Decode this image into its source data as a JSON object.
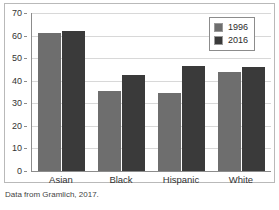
{
  "caption": "Data from Gramlich, 2017.",
  "legend": {
    "position": "top-right",
    "entries": [
      {
        "label": "1996",
        "color": "#6e6e6e",
        "icon": "legend-swatch-icon"
      },
      {
        "label": "2016",
        "color": "#3a3a3a",
        "icon": "legend-swatch-icon"
      }
    ]
  },
  "axis": {
    "y_ticks": [
      "70",
      "60",
      "50",
      "40",
      "30",
      "20",
      "10",
      "0"
    ]
  },
  "chart_data": {
    "type": "bar",
    "title": "",
    "subtitle": "",
    "xlabel": "",
    "ylabel": "",
    "categories": [
      "Asian",
      "Black",
      "Hispanic",
      "White"
    ],
    "series": [
      {
        "name": "1996",
        "color": "#6e6e6e",
        "values": [
          61,
          35.5,
          34.5,
          44
        ]
      },
      {
        "name": "2016",
        "color": "#3a3a3a",
        "values": [
          62,
          42.5,
          46.5,
          46
        ]
      }
    ],
    "ylim": [
      0,
      70
    ],
    "ytick_step": 10,
    "grid": true,
    "grid_axis": "y",
    "legend_position": "top-right",
    "annotations": [
      "Data from Gramlich, 2017."
    ]
  }
}
